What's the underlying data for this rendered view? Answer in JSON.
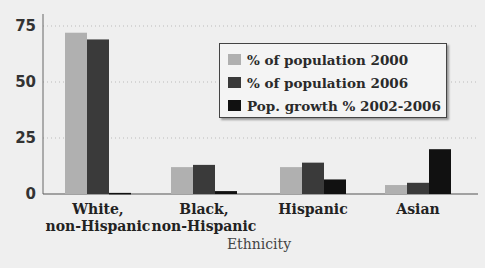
{
  "chart_data": {
    "type": "bar",
    "title": "",
    "xlabel": "Ethnicity",
    "ylabel": "",
    "ylim": [
      0,
      75
    ],
    "yticks": [
      0,
      25,
      50,
      75
    ],
    "grid": "horizontal dotted",
    "legend_position": "upper right",
    "categories": [
      "White, non-Hispanic",
      "Black, non-Hispanic",
      "Hispanic",
      "Asian"
    ],
    "category_lines": [
      [
        "White,",
        "non-Hispanic"
      ],
      [
        "Black,",
        "non-Hispanic"
      ],
      [
        "Hispanic"
      ],
      [
        "Asian"
      ]
    ],
    "series": [
      {
        "name": "% of population 2000",
        "color": "#b0b0b0",
        "values": [
          72,
          12,
          12,
          4
        ]
      },
      {
        "name": "% of population 2006",
        "color": "#3a3a3a",
        "values": [
          69,
          13,
          14,
          5
        ]
      },
      {
        "name": "Pop. growth % 2002-2006",
        "color": "#111111",
        "values": [
          0.5,
          1.3,
          6.5,
          20
        ]
      }
    ]
  },
  "legend": {
    "items": [
      {
        "label": "% of population 2000",
        "color": "#b0b0b0"
      },
      {
        "label": "% of population 2006",
        "color": "#3a3a3a"
      },
      {
        "label": "Pop. growth % 2002-2006",
        "color": "#111111"
      }
    ]
  }
}
